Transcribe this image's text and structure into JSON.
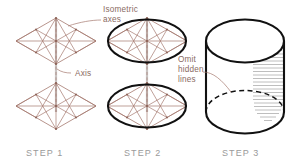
{
  "figure": {
    "background_color": "#ffffff",
    "construction_color": "#a5796e",
    "object_color": "#111111",
    "label_color": "#8a6a62",
    "step_label_color": "#9a9a9a",
    "shading_color": "#9a9a9a"
  },
  "annotations": [
    {
      "id": "isometric-axes",
      "text_lines": [
        "Isometric",
        "axes"
      ],
      "x": 103,
      "y": 12
    },
    {
      "id": "axis",
      "text_lines": [
        "Axis"
      ],
      "x": 72,
      "y": 74
    },
    {
      "id": "omit-hidden-lines",
      "text_lines": [
        "Omit",
        "hidden",
        "lines"
      ],
      "x": 178,
      "y": 67
    }
  ],
  "steps": [
    {
      "id": "step-1",
      "label": "STEP 1",
      "x": 47,
      "y": 156,
      "description": "Two isometric rhombi joined by a vertical axis with four-center ellipse construction lines"
    },
    {
      "id": "step-2",
      "label": "STEP 2",
      "x": 146,
      "y": 156,
      "description": "Ellipses inscribed in the top and bottom isometric rhombi"
    },
    {
      "id": "step-3",
      "label": "STEP 3",
      "x": 245,
      "y": 156,
      "description": "Completed shaded cylinder with hidden bottom arc dashed"
    }
  ],
  "step3": {
    "hidden_line_style": "dashed",
    "shading": "horizontal hatch lines on right side",
    "hatch_count": 26
  }
}
